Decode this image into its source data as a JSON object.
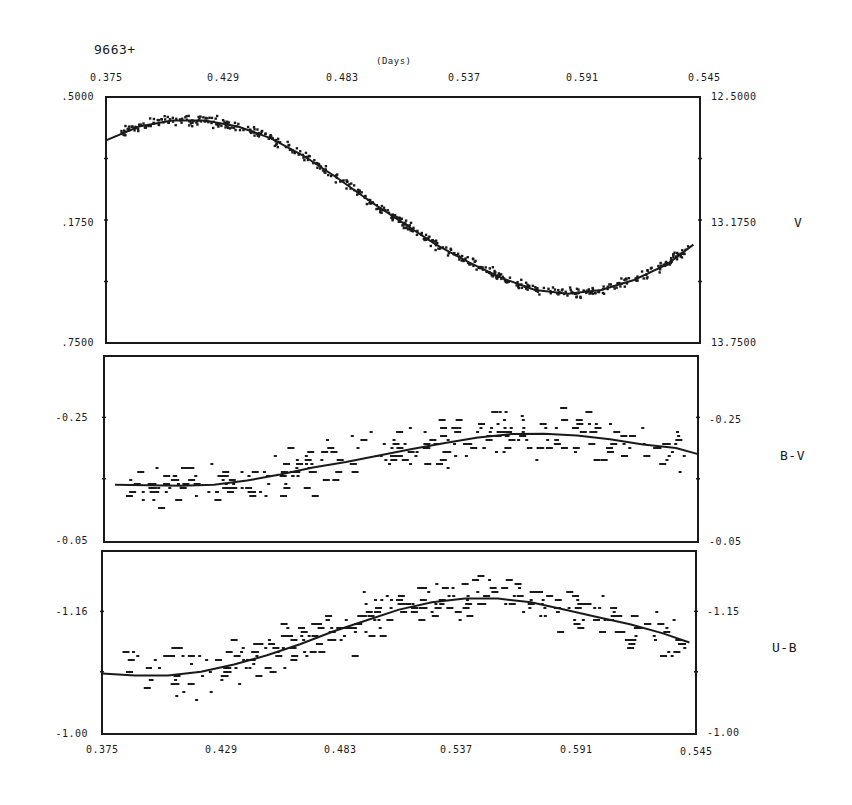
{
  "chart_data": [
    {
      "type": "scatter",
      "title": "9663+",
      "xlabel": "(Days)",
      "ylabel": "V",
      "x_ticks": [
        "0.375",
        "0.429",
        "0.483",
        "0.537",
        "0.591",
        "0.545"
      ],
      "xlim": [
        0.375,
        0.645
      ],
      "y_ticks_left": [
        ".5000",
        ".1750",
        ".7500"
      ],
      "y_ticks_right": [
        "12.5000",
        "13.1750",
        "13.7500"
      ],
      "ylim": [
        13.75,
        12.5
      ],
      "fit_curve": {
        "x": [
          0.375,
          0.39,
          0.405,
          0.42,
          0.435,
          0.45,
          0.465,
          0.48,
          0.495,
          0.51,
          0.525,
          0.54,
          0.555,
          0.57,
          0.585,
          0.6,
          0.615,
          0.63,
          0.642
        ],
        "y": [
          12.72,
          12.65,
          12.62,
          12.62,
          12.65,
          12.71,
          12.8,
          12.91,
          13.03,
          13.14,
          13.25,
          13.34,
          13.42,
          13.48,
          13.5,
          13.48,
          13.43,
          13.35,
          13.25
        ]
      }
    },
    {
      "type": "scatter",
      "ylabel": "B-V",
      "y_ticks_left": [
        "-0.25",
        "-0.05"
      ],
      "y_ticks_right": [
        "-0.25",
        "-0.05"
      ],
      "ylim": [
        -0.05,
        -0.45
      ],
      "fit_curve": {
        "x": [
          0.38,
          0.395,
          0.41,
          0.425,
          0.44,
          0.455,
          0.47,
          0.485,
          0.5,
          0.515,
          0.53,
          0.545,
          0.56,
          0.575,
          0.59,
          0.605,
          0.62,
          0.635,
          0.645
        ],
        "y": [
          -0.173,
          -0.172,
          -0.171,
          -0.173,
          -0.182,
          -0.195,
          -0.21,
          -0.222,
          -0.236,
          -0.25,
          -0.263,
          -0.275,
          -0.282,
          -0.283,
          -0.279,
          -0.271,
          -0.26,
          -0.252,
          -0.239
        ]
      }
    },
    {
      "type": "scatter",
      "ylabel": "U-B",
      "y_ticks_left": [
        "-1.16",
        "-1.00"
      ],
      "y_ticks_right": [
        "-1.15",
        "-1.00"
      ],
      "x_ticks_bottom": [
        "0.375",
        "0.429",
        "0.483",
        "0.537",
        "0.591",
        "0.545"
      ],
      "fit_curve": {
        "x": [
          0.375,
          0.39,
          0.405,
          0.42,
          0.435,
          0.45,
          0.465,
          0.48,
          0.495,
          0.51,
          0.525,
          0.54,
          0.555,
          0.57,
          0.585,
          0.6,
          0.615,
          0.63,
          0.642
        ],
        "y": [
          0.33,
          0.32,
          0.32,
          0.34,
          0.38,
          0.43,
          0.49,
          0.56,
          0.62,
          0.68,
          0.72,
          0.74,
          0.74,
          0.72,
          0.68,
          0.64,
          0.6,
          0.55,
          0.5
        ]
      }
    }
  ],
  "labels": {
    "star_id": "9663+",
    "x_unit": "(Days)",
    "top_x_ticks": [
      "0.375",
      "0.429",
      "0.483",
      "0.537",
      "0.591",
      "0.545"
    ],
    "bottom_x_ticks": [
      "0.375",
      "0.429",
      "0.483",
      "0.537",
      "0.591",
      "0.545"
    ],
    "v_left": [
      ".5000",
      ".1750",
      ".7500"
    ],
    "v_right": [
      "12.5000",
      "13.1750",
      "13.7500"
    ],
    "v_name": "V",
    "bv_left": [
      "-0.25",
      "-0.05"
    ],
    "bv_right": [
      "-0.25",
      "-0.05"
    ],
    "bv_name": "B-V",
    "ub_left": [
      "-1.16",
      "-1.00"
    ],
    "ub_right": [
      "-1.15",
      "-1.00"
    ],
    "ub_name": "U-B"
  }
}
